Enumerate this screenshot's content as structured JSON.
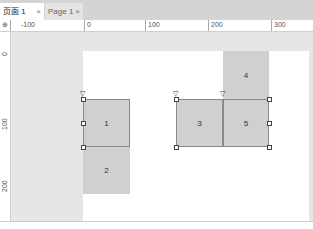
{
  "tabs": [
    {
      "label": "页面 1",
      "close": "×",
      "active": true
    },
    {
      "label": "Page 1",
      "close": "×",
      "active": false
    }
  ],
  "ruler": {
    "corner": "⊕",
    "h_labels": [
      "-100",
      "0",
      "100",
      "200",
      "300"
    ],
    "v_labels": [
      "0",
      "100",
      "200"
    ]
  },
  "shapes": [
    {
      "label": "1"
    },
    {
      "label": "2"
    },
    {
      "label": "3"
    },
    {
      "label": "4"
    },
    {
      "label": "5"
    }
  ],
  "colors": {
    "shape_fill": "#d0d0d0",
    "canvas": "#e6e6e6",
    "page": "#ffffff"
  }
}
